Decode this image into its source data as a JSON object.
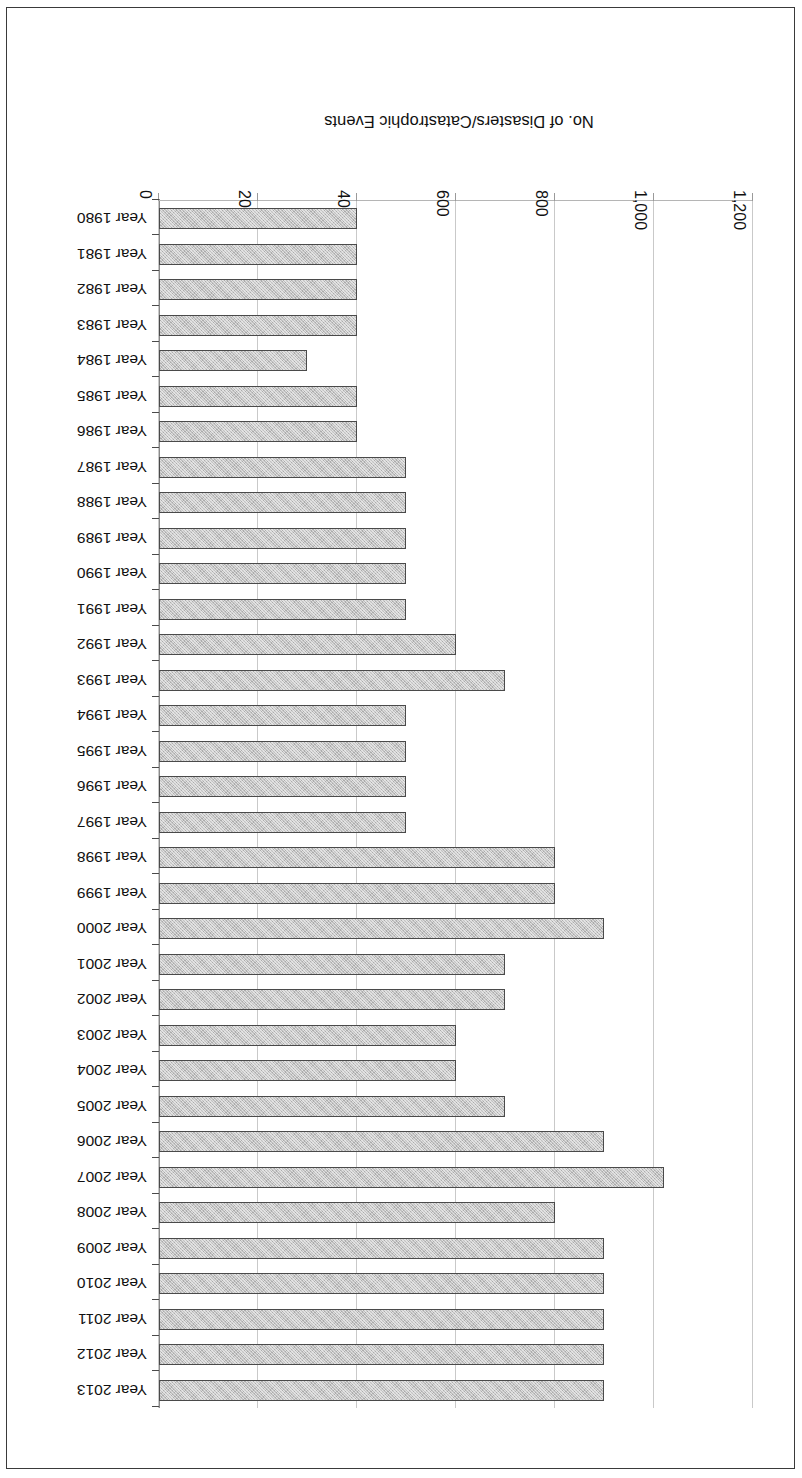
{
  "chart_data": {
    "type": "bar",
    "orientation": "horizontal",
    "title": "",
    "subtitle": "",
    "xlabel": "No. of Disasters/Catastrophic Events",
    "ylabel": "",
    "value_axis_label": "No. of Disasters/Catastrophic Events",
    "value_ticks": [
      "0",
      "200",
      "400",
      "600",
      "800",
      "1,000",
      "1,200"
    ],
    "value_tick_numbers": [
      0,
      200,
      400,
      600,
      800,
      1000,
      1200
    ],
    "xlim": [
      0,
      1200
    ],
    "grid": true,
    "legend": "none",
    "page_rotation_degrees": 180,
    "series_name": "No. of Disasters/Catastrophic Events",
    "categories": [
      "Year 1980",
      "Year 1981",
      "Year 1982",
      "Year 1983",
      "Year 1984",
      "Year 1985",
      "Year 1986",
      "Year 1987",
      "Year 1988",
      "Year 1989",
      "Year 1990",
      "Year 1991",
      "Year 1992",
      "Year 1993",
      "Year 1994",
      "Year 1995",
      "Year 1996",
      "Year 1997",
      "Year 1998",
      "Year 1999",
      "Year 2000",
      "Year 2001",
      "Year 2002",
      "Year 2003",
      "Year 2004",
      "Year 2005",
      "Year 2006",
      "Year 2007",
      "Year 2008",
      "Year 2009",
      "Year 2010",
      "Year 2011",
      "Year 2012",
      "Year 2013"
    ],
    "values": [
      400,
      400,
      400,
      400,
      300,
      400,
      400,
      500,
      500,
      500,
      500,
      500,
      600,
      700,
      500,
      500,
      500,
      500,
      800,
      800,
      900,
      700,
      700,
      600,
      600,
      700,
      900,
      1020,
      800,
      900,
      900,
      900,
      900,
      900
    ]
  },
  "style": {
    "bar_fill": "#c2c2c2",
    "bar_border": "#4a4a4a",
    "gridline_color": "#c9c9c9",
    "axis_color": "#8a8a8a",
    "text_color": "#111111",
    "page_border": "#3a3a3a",
    "background": "#ffffff"
  }
}
